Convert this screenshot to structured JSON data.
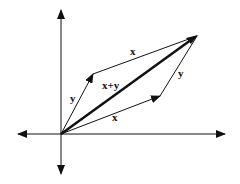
{
  "diagram": {
    "colors": {
      "stroke": "#111111",
      "background": "#ffffff"
    },
    "axes": {
      "origin": [
        61,
        134
      ],
      "horizontal": {
        "from": [
          16,
          134
        ],
        "to": [
          227,
          134
        ],
        "arrows": "both"
      },
      "vertical": {
        "from": [
          61,
          8
        ],
        "to": [
          61,
          176
        ],
        "arrows": "both"
      }
    },
    "vectors": [
      {
        "name": "y",
        "from": [
          61,
          134
        ],
        "to": [
          93,
          74
        ],
        "weight": "thin"
      },
      {
        "name": "x",
        "from": [
          61,
          134
        ],
        "to": [
          160,
          96
        ],
        "weight": "thin"
      },
      {
        "name": "x-top",
        "from": [
          93,
          74
        ],
        "to": [
          197,
          36
        ],
        "weight": "thin"
      },
      {
        "name": "y-right",
        "from": [
          160,
          96
        ],
        "to": [
          197,
          36
        ],
        "weight": "thin"
      },
      {
        "name": "x+y",
        "from": [
          61,
          134
        ],
        "to": [
          197,
          36
        ],
        "weight": "bold"
      }
    ],
    "labels": {
      "x_top": "x",
      "y_right": "y",
      "sum": "x+y",
      "y_left": "y",
      "x_bottom": "x"
    }
  }
}
